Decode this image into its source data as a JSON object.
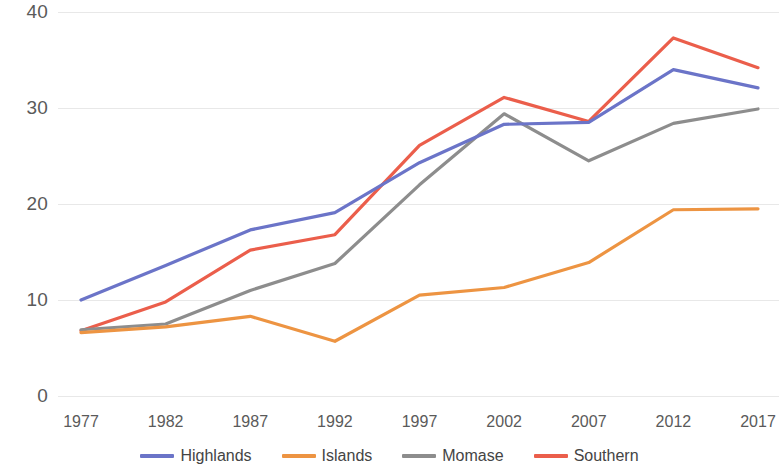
{
  "chart_data": {
    "type": "line",
    "title": "",
    "subtitle": "",
    "xlabel": "",
    "ylabel": "",
    "categories": [
      "1977",
      "1982",
      "1987",
      "1992",
      "1997",
      "2002",
      "2007",
      "2012",
      "2017"
    ],
    "ylim": [
      0,
      40
    ],
    "yticks": [
      0,
      10,
      20,
      30,
      40
    ],
    "ytick_labels": [
      "0",
      "10",
      "20",
      "30",
      "40"
    ],
    "grid": true,
    "grid_axis": "y",
    "legend_position": "bottom",
    "series": [
      {
        "name": "Highlands",
        "color": "#6b74c8",
        "values": [
          10.0,
          13.6,
          17.3,
          19.1,
          24.3,
          28.3,
          28.5,
          34.0,
          32.1
        ]
      },
      {
        "name": "Islands",
        "color": "#ed9442",
        "values": [
          6.6,
          7.2,
          8.3,
          5.7,
          10.5,
          11.3,
          13.9,
          19.4,
          19.5
        ]
      },
      {
        "name": "Momase",
        "color": "#8d8d8d",
        "values": [
          6.9,
          7.5,
          11.0,
          13.8,
          22.0,
          29.4,
          24.5,
          28.4,
          29.9
        ]
      },
      {
        "name": "Southern",
        "color": "#eb5e4b",
        "values": [
          6.8,
          9.8,
          15.2,
          16.8,
          26.1,
          31.1,
          28.6,
          37.3,
          34.2
        ]
      }
    ]
  }
}
